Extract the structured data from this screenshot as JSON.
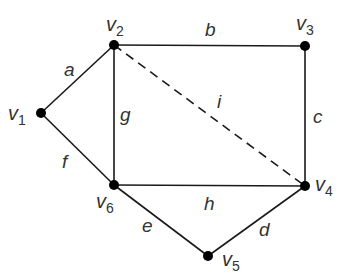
{
  "diagram": {
    "type": "graph",
    "vertices": [
      {
        "id": "v1",
        "label": "v",
        "sub": "1",
        "x": 41,
        "y": 113
      },
      {
        "id": "v2",
        "label": "v",
        "sub": "2",
        "x": 114,
        "y": 45
      },
      {
        "id": "v3",
        "label": "v",
        "sub": "3",
        "x": 305,
        "y": 46
      },
      {
        "id": "v4",
        "label": "v",
        "sub": "4",
        "x": 305,
        "y": 186
      },
      {
        "id": "v5",
        "label": "v",
        "sub": "5",
        "x": 208,
        "y": 256
      },
      {
        "id": "v6",
        "label": "v",
        "sub": "6",
        "x": 114,
        "y": 185
      }
    ],
    "edges": [
      {
        "id": "a",
        "label": "a",
        "from": "v1",
        "to": "v2",
        "style": "solid"
      },
      {
        "id": "b",
        "label": "b",
        "from": "v2",
        "to": "v3",
        "style": "solid"
      },
      {
        "id": "c",
        "label": "c",
        "from": "v3",
        "to": "v4",
        "style": "solid"
      },
      {
        "id": "d",
        "label": "d",
        "from": "v4",
        "to": "v5",
        "style": "solid"
      },
      {
        "id": "e",
        "label": "e",
        "from": "v5",
        "to": "v6",
        "style": "solid"
      },
      {
        "id": "f",
        "label": "f",
        "from": "v6",
        "to": "v1",
        "style": "solid"
      },
      {
        "id": "g",
        "label": "g",
        "from": "v2",
        "to": "v6",
        "style": "solid"
      },
      {
        "id": "h",
        "label": "h",
        "from": "v6",
        "to": "v4",
        "style": "solid"
      },
      {
        "id": "i",
        "label": "i",
        "from": "v2",
        "to": "v4",
        "style": "dashed"
      }
    ],
    "colors": {
      "edge": "#1a1a1a",
      "vertex": "#000000",
      "label": "#333333"
    }
  }
}
